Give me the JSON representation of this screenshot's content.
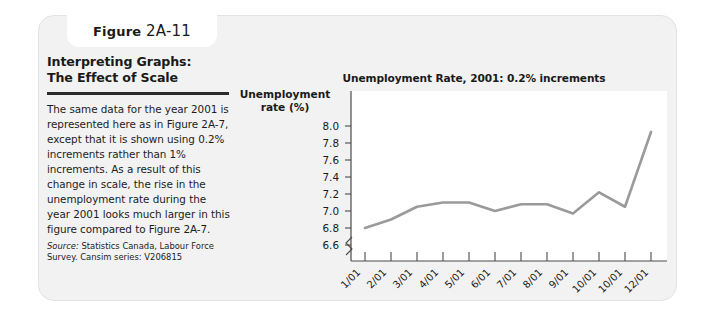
{
  "figure": {
    "label_word": "Figure",
    "number": "2A-11"
  },
  "panel": {
    "title_line1": "Interpreting Graphs:",
    "title_line2": "The Effect of Scale",
    "body": "The same data for the year 2001 is represented here as in Figure 2A-7, except that it is shown using 0.2% increments rather than 1% increments. As a result of this change in scale, the rise in the unemployment rate during the year 2001 looks much larger in this figure compared to Figure 2A-7.",
    "source_label": "Source:",
    "source_text": " Statistics Canada, Labour Force Survey. Cansim series: V206815"
  },
  "chart_data": {
    "type": "line",
    "title": "Unemployment Rate, 2001: 0.2% increments",
    "ylabel": "Unemployment rate (%)",
    "ylabel_line1": "Unemployment",
    "ylabel_line2": "rate (%)",
    "xlabel": "",
    "categories": [
      "1/01",
      "2/01",
      "3/01",
      "4/01",
      "5/01",
      "6/01",
      "7/01",
      "8/01",
      "9/01",
      "10/01",
      "10/01",
      "12/01"
    ],
    "values": [
      6.8,
      6.9,
      7.05,
      7.1,
      7.1,
      7.0,
      7.08,
      7.08,
      6.97,
      7.22,
      7.05,
      7.93
    ],
    "yticks": [
      "8.0",
      "7.8",
      "7.6",
      "7.4",
      "7.2",
      "7.0",
      "6.8",
      "6.6"
    ],
    "ytick_values": [
      8.0,
      7.8,
      7.6,
      7.4,
      7.2,
      7.0,
      6.8,
      6.6
    ],
    "ylim": [
      6.6,
      8.0
    ],
    "axis_break": true,
    "grid": false,
    "legend": "none",
    "line_color": "#9a9a9a"
  },
  "colors": {
    "card_bg": "#f2f2f2",
    "plot_bg": "#ffffff",
    "text": "#1a1a1a",
    "line": "#9a9a9a",
    "rule": "#2b2b2b"
  }
}
